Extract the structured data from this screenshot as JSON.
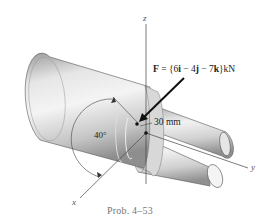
{
  "figure": {
    "force_label": {
      "prefix": "F",
      "equals": " = {6",
      "i": "i",
      "m1": " − 4",
      "j": "j",
      "m2": " − 7",
      "k": "k",
      "suffix": "}kN",
      "full": "F = {6i − 4j − 7k} kN"
    },
    "dimension_label": "30 mm",
    "angle_label": "40°",
    "axes": {
      "x": "x",
      "y": "y",
      "z": "z"
    },
    "caption": "Prob. 4–53"
  },
  "colors": {
    "shaft_light": "#f2f2f2",
    "shaft_mid": "#c8c8c8",
    "shaft_dark": "#8a8a8a",
    "line": "#333333",
    "caption": "#777777"
  }
}
